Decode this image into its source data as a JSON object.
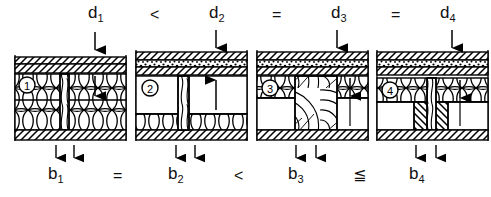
{
  "figure": {
    "type": "technical-cross-section-diagram",
    "background_color": "#ffffff",
    "line_color": "#000000",
    "panel_count": 4
  },
  "top_row": {
    "label": "thickness-comparison",
    "sequence": "d1 < d2 = d3 = d4",
    "items": [
      {
        "symbol": "d",
        "index": "1",
        "x": 95,
        "y": 6
      },
      {
        "symbol": "d",
        "index": "2",
        "x": 216,
        "y": 6
      },
      {
        "symbol": "d",
        "index": "3",
        "x": 337,
        "y": 6
      },
      {
        "symbol": "d",
        "index": "4",
        "x": 445,
        "y": 6
      }
    ],
    "operators": [
      {
        "symbol": "<",
        "x": 152,
        "y": 9
      },
      {
        "symbol": "=",
        "x": 275,
        "y": 9
      },
      {
        "symbol": "=",
        "x": 393,
        "y": 9
      }
    ]
  },
  "bottom_row": {
    "label": "width-comparison",
    "sequence": "b1 = b2 < b3 ≦ b4",
    "items": [
      {
        "symbol": "b",
        "index": "1",
        "x": 52,
        "y": 167
      },
      {
        "symbol": "b",
        "index": "2",
        "x": 172,
        "y": 167
      },
      {
        "symbol": "b",
        "index": "3",
        "x": 293,
        "y": 167
      },
      {
        "symbol": "b",
        "index": "4",
        "x": 413,
        "y": 167
      }
    ],
    "operators": [
      {
        "symbol": "=",
        "x": 115,
        "y": 170
      },
      {
        "symbol": "<",
        "x": 236,
        "y": 170
      },
      {
        "symbol": "≦",
        "x": 355,
        "y": 170
      }
    ]
  },
  "panels": [
    {
      "number": "1",
      "badge": "①",
      "x": 14,
      "y": 53,
      "width": 112,
      "height": 88,
      "top_layers": [
        "hatch-diagonal",
        "hatch-diagonal"
      ],
      "core": "insulation-wool",
      "stud": "timber-narrow",
      "bottom_layer": "hatch-diagonal",
      "d_arrow_x": 95,
      "inner_arrow_x": 95,
      "b_marks_x": [
        56,
        74
      ]
    },
    {
      "number": "2",
      "badge": "②",
      "x": 135,
      "y": 48,
      "width": 112,
      "height": 93,
      "top_layers": [
        "hatch-diagonal",
        "stipple-gravel",
        "hatch-diagonal"
      ],
      "core": "cavity-empty",
      "stud": "timber-grain",
      "bottom_layer": "insulation-plus-hatch",
      "d_arrow_x": 216,
      "inner_arrow_x": 216,
      "b_marks_x": [
        176,
        195
      ]
    },
    {
      "number": "3",
      "badge": "③",
      "x": 256,
      "y": 48,
      "width": 112,
      "height": 93,
      "top_layers": [
        "hatch-diagonal",
        "stipple-gravel",
        "hatch-diagonal"
      ],
      "core": "insulation-wool-split",
      "stud": "timber-wide-grain",
      "bottom_layer": "hatch-diagonal",
      "d_arrow_x": 337,
      "inner_arrow_x": 337,
      "b_marks_x": [
        296,
        316
      ]
    },
    {
      "number": "4",
      "badge": "④",
      "x": 376,
      "y": 48,
      "width": 112,
      "height": 93,
      "top_layers": [
        "hatch-diagonal",
        "stipple-gravel",
        "hatch-diagonal"
      ],
      "core": "insulation-wool",
      "stud": "timber-grain-double-flank",
      "bottom_layer": "hatch-diagonal",
      "d_arrow_x": 452,
      "inner_arrow_x": 452,
      "b_marks_x": [
        416,
        436
      ]
    }
  ]
}
